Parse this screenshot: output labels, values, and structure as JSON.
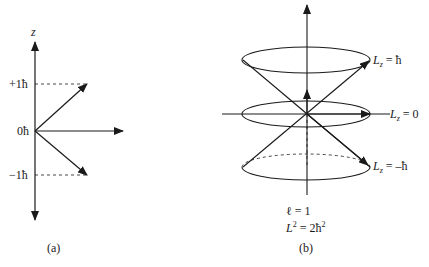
{
  "panel_a": {
    "axis_label": "z",
    "tick_labels": [
      "+1ħ",
      "0ħ",
      "−1ħ"
    ],
    "caption": "(a)"
  },
  "panel_b": {
    "labels": {
      "top": "L",
      "top_sub": "z",
      "top_val": " = ħ",
      "mid": "L",
      "mid_sub": "z",
      "mid_val": " = 0",
      "bot": "L",
      "bot_sub": "z",
      "bot_val": " = –ħ"
    },
    "quantum_number": "ℓ = 1",
    "l_squared_prefix": "L",
    "l_squared_sup": "2",
    "l_squared_mid": " = 2ħ",
    "l_squared_sup2": "2",
    "caption": "(b)"
  }
}
